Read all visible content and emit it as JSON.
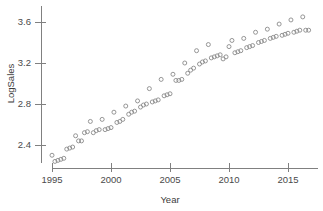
{
  "figure": {
    "background_color": "#ffffff",
    "axis_color": "#808080",
    "marker_color": "#8a8a8a",
    "text_color": "#4a4a4a"
  },
  "chart_data": {
    "type": "scatter",
    "title": "",
    "xlabel": "Year",
    "ylabel": "LogSales",
    "xlim": [
      1994.6,
      2017.0
    ],
    "ylim": [
      2.2,
      3.72
    ],
    "xticks": [
      1995,
      2000,
      2005,
      2010,
      2015
    ],
    "xticklabels": [
      "1995",
      "2000",
      "2005",
      "2010",
      "2015"
    ],
    "yticks": [
      2.4,
      2.8,
      3.2,
      3.6
    ],
    "yticklabels": [
      "2.4",
      "2.8",
      "3.2",
      "3.6"
    ],
    "grid": false,
    "legend": null,
    "marker_style": "open-circle",
    "marker_size": 4.0,
    "series": [
      {
        "name": "LogSales",
        "x": [
          1995.0,
          1995.25,
          1995.5,
          1995.75,
          1996.0,
          1996.25,
          1996.5,
          1996.75,
          1997.0,
          1997.25,
          1997.5,
          1997.75,
          1998.0,
          1998.25,
          1998.5,
          1998.75,
          1999.0,
          1999.25,
          1999.5,
          1999.75,
          2000.0,
          2000.25,
          2000.5,
          2000.75,
          2001.0,
          2001.25,
          2001.5,
          2001.75,
          2002.0,
          2002.25,
          2002.5,
          2002.75,
          2003.0,
          2003.25,
          2003.5,
          2003.75,
          2004.0,
          2004.25,
          2004.5,
          2004.75,
          2005.0,
          2005.25,
          2005.5,
          2005.75,
          2006.0,
          2006.25,
          2006.5,
          2006.75,
          2007.0,
          2007.25,
          2007.5,
          2007.75,
          2008.0,
          2008.25,
          2008.5,
          2008.75,
          2009.0,
          2009.25,
          2009.5,
          2009.75,
          2010.0,
          2010.25,
          2010.5,
          2010.75,
          2011.0,
          2011.25,
          2011.5,
          2011.75,
          2012.0,
          2012.25,
          2012.5,
          2012.75,
          2013.0,
          2013.25,
          2013.5,
          2013.75,
          2014.0,
          2014.25,
          2014.5,
          2014.75,
          2015.0,
          2015.25,
          2015.5,
          2015.75,
          2016.0,
          2016.25,
          2016.5,
          2016.75
        ],
        "y": [
          2.3,
          2.24,
          2.25,
          2.26,
          2.27,
          2.36,
          2.37,
          2.38,
          2.49,
          2.44,
          2.44,
          2.52,
          2.53,
          2.63,
          2.52,
          2.54,
          2.55,
          2.65,
          2.55,
          2.56,
          2.57,
          2.72,
          2.62,
          2.63,
          2.65,
          2.78,
          2.7,
          2.72,
          2.73,
          2.83,
          2.77,
          2.79,
          2.8,
          2.95,
          2.82,
          2.83,
          2.84,
          3.04,
          2.88,
          2.89,
          2.9,
          3.09,
          3.03,
          3.03,
          3.04,
          3.2,
          3.1,
          3.13,
          3.15,
          3.32,
          3.19,
          3.21,
          3.22,
          3.38,
          3.25,
          3.26,
          3.27,
          3.28,
          3.24,
          3.26,
          3.36,
          3.42,
          3.3,
          3.31,
          3.32,
          3.44,
          3.35,
          3.36,
          3.37,
          3.5,
          3.4,
          3.41,
          3.42,
          3.53,
          3.44,
          3.45,
          3.46,
          3.58,
          3.47,
          3.48,
          3.49,
          3.62,
          3.5,
          3.51,
          3.52,
          3.65,
          3.52,
          3.52
        ]
      }
    ]
  }
}
